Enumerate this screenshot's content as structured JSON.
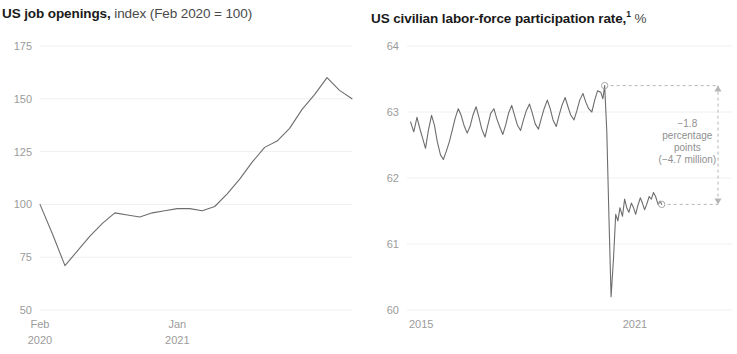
{
  "panels": [
    {
      "id": "job-openings",
      "title_strong": "US job openings,",
      "title_light": " index (Feb 2020 = 100)",
      "title_sup": ""
    },
    {
      "id": "participation-rate",
      "title_strong": "US civilian labor-force participation rate,",
      "title_light": " %",
      "title_sup": "1"
    }
  ],
  "chart_data": [
    {
      "type": "line",
      "title": "US job openings, index (Feb 2020 = 100)",
      "xlabel": "",
      "ylabel": "index (Feb 2020 = 100)",
      "ylim": [
        50,
        175
      ],
      "yticks": [
        50,
        75,
        100,
        125,
        150,
        175
      ],
      "ytick_labels": [
        "50",
        "75",
        "100",
        "125",
        "150",
        "175"
      ],
      "xlim": [
        0,
        25
      ],
      "xticks": [
        0,
        11
      ],
      "xtick_labels": [
        [
          "Feb",
          "2020"
        ],
        [
          "Jan",
          "2021"
        ]
      ],
      "grid": true,
      "legend": "none",
      "series": [
        {
          "name": "US job openings index",
          "x": [
            0,
            1,
            2,
            3,
            4,
            5,
            6,
            7,
            8,
            9,
            10,
            11,
            12,
            13,
            14,
            15,
            16,
            17,
            18,
            19,
            20,
            21,
            22,
            23,
            24,
            25
          ],
          "values": [
            100,
            86,
            71,
            78,
            85,
            91,
            96,
            95,
            94,
            96,
            97,
            98,
            98,
            97,
            99,
            105,
            112,
            120,
            127,
            130,
            136,
            145,
            152,
            160,
            154,
            150
          ]
        }
      ]
    },
    {
      "type": "line",
      "title": "US civilian labor-force participation rate, %",
      "xlabel": "",
      "ylabel": "%",
      "ylim": [
        60,
        64
      ],
      "yticks": [
        60,
        61,
        62,
        63,
        64
      ],
      "ytick_labels": [
        "60",
        "61",
        "62",
        "63",
        "64"
      ],
      "xlim": [
        2014.6,
        2021.9
      ],
      "xticks": [
        2015,
        2021
      ],
      "xtick_labels": [
        "2015",
        "2021"
      ],
      "grid": true,
      "legend": "none",
      "annotations": [
        {
          "name": "drop-callout",
          "lines": [
            "−1.8",
            "percentage",
            "points",
            "(−4.7 million)"
          ],
          "from_value": 63.4,
          "to_value": 61.6
        }
      ],
      "markers": [
        {
          "name": "pre-pandemic-peak",
          "x": 2020.15,
          "value": 63.4
        },
        {
          "name": "latest-value",
          "x": 2021.75,
          "value": 61.6
        }
      ],
      "series": [
        {
          "name": "US civilian labor-force participation rate",
          "x": [
            2014.7,
            2014.79,
            2014.88,
            2014.96,
            2015.04,
            2015.12,
            2015.2,
            2015.29,
            2015.37,
            2015.45,
            2015.54,
            2015.62,
            2015.7,
            2015.79,
            2015.87,
            2015.95,
            2016.04,
            2016.12,
            2016.2,
            2016.29,
            2016.37,
            2016.45,
            2016.54,
            2016.62,
            2016.7,
            2016.79,
            2016.87,
            2016.95,
            2017.04,
            2017.12,
            2017.2,
            2017.29,
            2017.37,
            2017.45,
            2017.54,
            2017.62,
            2017.7,
            2017.79,
            2017.87,
            2017.95,
            2018.04,
            2018.12,
            2018.2,
            2018.29,
            2018.37,
            2018.45,
            2018.54,
            2018.62,
            2018.7,
            2018.79,
            2018.87,
            2018.95,
            2019.04,
            2019.12,
            2019.2,
            2019.29,
            2019.37,
            2019.45,
            2019.54,
            2019.62,
            2019.7,
            2019.79,
            2019.87,
            2019.95,
            2020.04,
            2020.1,
            2020.15,
            2020.21,
            2020.27,
            2020.33,
            2020.4,
            2020.46,
            2020.52,
            2020.58,
            2020.65,
            2020.71,
            2020.77,
            2020.83,
            2020.9,
            2020.96,
            2021.02,
            2021.08,
            2021.15,
            2021.21,
            2021.27,
            2021.33,
            2021.4,
            2021.46,
            2021.52,
            2021.58,
            2021.65,
            2021.71,
            2021.75
          ],
          "values": [
            62.85,
            62.7,
            62.92,
            62.75,
            62.6,
            62.45,
            62.72,
            62.95,
            62.8,
            62.55,
            62.35,
            62.28,
            62.4,
            62.55,
            62.72,
            62.9,
            63.05,
            62.95,
            62.8,
            62.68,
            62.78,
            62.95,
            63.08,
            62.92,
            62.74,
            62.62,
            62.8,
            62.98,
            63.05,
            62.9,
            62.78,
            62.66,
            62.8,
            62.98,
            63.1,
            62.95,
            62.8,
            62.72,
            62.88,
            63.02,
            63.12,
            62.98,
            62.82,
            62.74,
            62.9,
            63.05,
            63.18,
            63.05,
            62.88,
            62.78,
            62.95,
            63.1,
            63.22,
            63.08,
            62.95,
            62.88,
            63.02,
            63.18,
            63.28,
            63.15,
            63.05,
            63.0,
            63.18,
            63.32,
            63.3,
            63.2,
            63.4,
            62.7,
            61.4,
            60.2,
            60.8,
            61.45,
            61.35,
            61.55,
            61.42,
            61.68,
            61.55,
            61.48,
            61.62,
            61.55,
            61.45,
            61.58,
            61.7,
            61.62,
            61.52,
            61.6,
            61.72,
            61.68,
            61.78,
            61.72,
            61.6,
            61.65,
            61.6
          ]
        }
      ]
    }
  ]
}
